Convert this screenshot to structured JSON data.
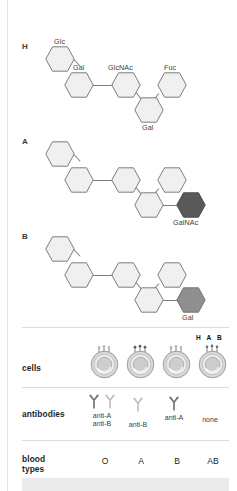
{
  "figure": {
    "panels": [
      {
        "letter": "H",
        "name": "h-antigen-structure",
        "sugars": [
          "Glc",
          "Gal",
          "GlcNAc",
          "Fuc",
          "Gal"
        ],
        "terminal": null
      },
      {
        "letter": "A",
        "name": "a-antigen-structure",
        "sugars": [
          "Glc",
          "Gal",
          "GlcNAc",
          "Fuc",
          "Gal"
        ],
        "terminal": "GalNAc",
        "terminal_color": "#595959"
      },
      {
        "letter": "B",
        "name": "b-antigen-structure",
        "sugars": [
          "Glc",
          "Gal",
          "GlcNAc",
          "Fuc",
          "Gal"
        ],
        "terminal": "Gal",
        "terminal_color": "#8f8f8f"
      }
    ],
    "labels": {
      "glc": "Glc",
      "gal": "Gal",
      "glcnac": "GlcNAc",
      "fuc": "Fuc",
      "gal_branch": "Gal",
      "galnac": "GalNAc",
      "gal_terminal": "Gal"
    },
    "colors": {
      "hex_light": "#f0f0f0",
      "hex_stroke": "#7d7d7d",
      "galnac_dark": "#595959",
      "gal_medium": "#8f8f8f",
      "antibody_dark": "#6e6e6e",
      "antibody_light": "#bdbdbd"
    }
  },
  "table": {
    "row_labels": {
      "cells": "cells",
      "antibodies": "antibodies",
      "blood_types_line1": "blood",
      "blood_types_line2": "types"
    },
    "columns": [
      {
        "blood_type": "O",
        "cell_name": "red-cell-type-o",
        "antigen_markers": 3,
        "antibodies": [
          "anti-A",
          "anti-B"
        ],
        "antibody_count": 2,
        "hab_label": null
      },
      {
        "blood_type": "A",
        "cell_name": "red-cell-type-a",
        "antigen_markers": 3,
        "antibodies": [
          "anti-B"
        ],
        "antibody_count": 1,
        "hab_label": null
      },
      {
        "blood_type": "B",
        "cell_name": "red-cell-type-b",
        "antigen_markers": 3,
        "antibodies": [
          "anti-A"
        ],
        "antibody_count": 1,
        "hab_label": null
      },
      {
        "blood_type": "AB",
        "cell_name": "red-cell-type-ab",
        "antigen_markers": 3,
        "antibodies": [
          "none"
        ],
        "antibody_count": 0,
        "hab_label": "H A B"
      }
    ]
  }
}
